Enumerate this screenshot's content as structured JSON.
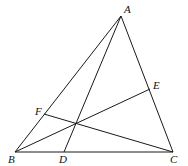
{
  "diagram": {
    "type": "triangle-cevians",
    "stroke_color": "#1a1a1a",
    "points": {
      "A": {
        "x": 121,
        "y": 16,
        "label": "A",
        "lx": 124,
        "ly": 13
      },
      "B": {
        "x": 15,
        "y": 152,
        "label": "B",
        "lx": 8,
        "ly": 163
      },
      "C": {
        "x": 173,
        "y": 152,
        "label": "C",
        "lx": 170,
        "ly": 163
      },
      "D": {
        "x": 64,
        "y": 152,
        "label": "D",
        "lx": 59,
        "ly": 163
      },
      "E": {
        "x": 150,
        "y": 89,
        "label": "E",
        "lx": 153,
        "ly": 89
      },
      "F": {
        "x": 44,
        "y": 114,
        "label": "F",
        "lx": 35,
        "ly": 115
      },
      "O": {
        "x": 75,
        "y": 123
      }
    },
    "segments": [
      [
        "A",
        "B"
      ],
      [
        "B",
        "C"
      ],
      [
        "C",
        "A"
      ],
      [
        "A",
        "D"
      ],
      [
        "B",
        "E"
      ],
      [
        "C",
        "F"
      ]
    ]
  }
}
